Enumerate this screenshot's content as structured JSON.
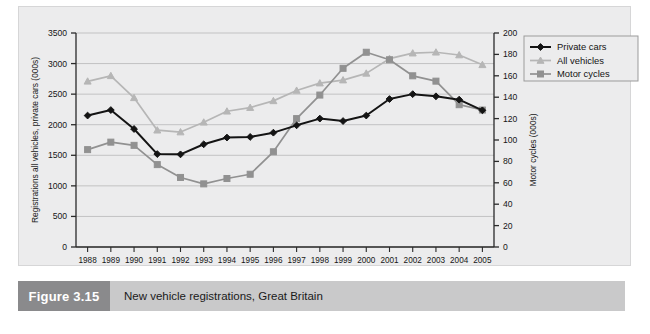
{
  "figure": {
    "caption_number": "Figure 3.15",
    "caption_text": "New vehicle registrations, Great Britain"
  },
  "chart_data": {
    "type": "line",
    "title": "",
    "subtitle": "",
    "xlabel": "",
    "ylabel": "Registrations all vehicles, private cars (000s)",
    "y2label": "Motor cycles (000s)",
    "categories": [
      "1988",
      "1989",
      "1990",
      "1991",
      "1992",
      "1993",
      "1994",
      "1995",
      "1996",
      "1997",
      "1998",
      "1999",
      "2000",
      "2001",
      "2002",
      "2003",
      "2004",
      "2005"
    ],
    "ylim": [
      0,
      3500
    ],
    "yticks": [
      0,
      500,
      1000,
      1500,
      2000,
      2500,
      3000,
      3500
    ],
    "y2lim": [
      0,
      200
    ],
    "y2ticks": [
      0,
      20,
      40,
      60,
      80,
      100,
      120,
      140,
      160,
      180,
      200
    ],
    "grid": true,
    "legend_position": "top-right",
    "series": [
      {
        "name": "Private cars",
        "axis": "left",
        "color": "#141414",
        "marker": "diamond",
        "values": [
          2150,
          2240,
          1930,
          1520,
          1515,
          1680,
          1790,
          1800,
          1870,
          1990,
          2100,
          2060,
          2150,
          2420,
          2500,
          2465,
          2410,
          2235
        ]
      },
      {
        "name": "All vehicles",
        "axis": "left",
        "color": "#b6b6b6",
        "marker": "triangle",
        "values": [
          2710,
          2800,
          2440,
          1910,
          1880,
          2040,
          2220,
          2280,
          2390,
          2560,
          2680,
          2730,
          2840,
          3080,
          3170,
          3185,
          3140,
          2980
        ]
      },
      {
        "name": "Motor cycles",
        "axis": "right",
        "color": "#919191",
        "marker": "square",
        "values": [
          91,
          98,
          95,
          77,
          65,
          59,
          64,
          68,
          89,
          120,
          142,
          167,
          182,
          175,
          160,
          155,
          133,
          128
        ]
      }
    ],
    "legend": [
      "Private cars",
      "All vehicles",
      "Motor cycles"
    ]
  }
}
